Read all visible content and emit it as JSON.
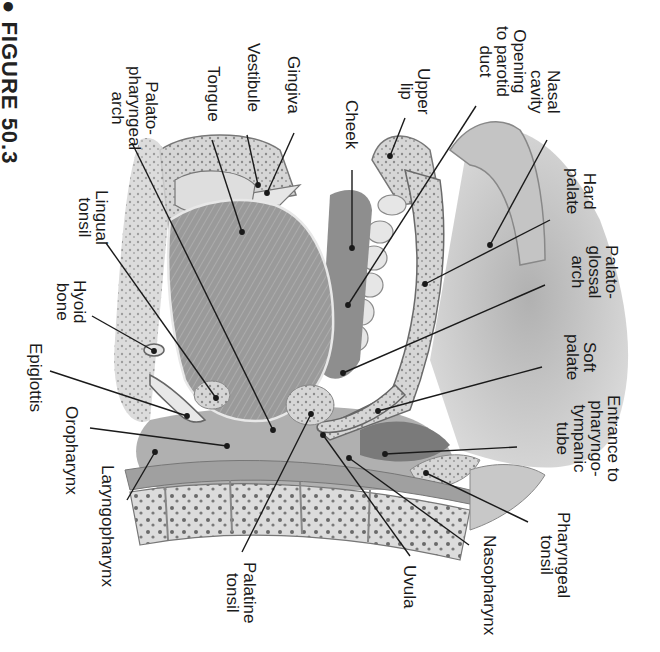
{
  "figure": {
    "caption": "● FIGURE 50.3",
    "orientation": "rotated 90° clockwise"
  },
  "labels": [
    {
      "id": "nasal-cavity",
      "text": "Nasal\ncavity",
      "x": 562,
      "y": 70
    },
    {
      "id": "opening-parotid-duct",
      "text": "Opening\nto parotid\nduct",
      "x": 528,
      "y": 26
    },
    {
      "id": "upper-lip",
      "text": "Upper\nlip",
      "x": 432,
      "y": 68
    },
    {
      "id": "cheek",
      "text": "Cheek",
      "x": 360,
      "y": 100
    },
    {
      "id": "gingiva",
      "text": "Gingiva",
      "x": 302,
      "y": 56
    },
    {
      "id": "vestibule",
      "text": "Vestibule",
      "x": 262,
      "y": 43
    },
    {
      "id": "tongue",
      "text": "Tongue",
      "x": 222,
      "y": 66
    },
    {
      "id": "palatopharyngeal-arch",
      "text": "Palato-\npharyngeal\narch",
      "x": 160,
      "y": 66
    },
    {
      "id": "hard-palate",
      "text": "Hard\npalate",
      "x": 598,
      "y": 168
    },
    {
      "id": "palatoglossal-arch",
      "text": "Palato-\nglossal\narch",
      "x": 620,
      "y": 245
    },
    {
      "id": "lingual-tonsil",
      "text": "Lingual\ntonsil",
      "x": 110,
      "y": 190
    },
    {
      "id": "hyoid-bone",
      "text": "Hyoid\nbone",
      "x": 88,
      "y": 280
    },
    {
      "id": "soft-palate",
      "text": "Soft\npalate",
      "x": 598,
      "y": 334
    },
    {
      "id": "epiglottis",
      "text": "Epiglottis",
      "x": 44,
      "y": 343
    },
    {
      "id": "oropharynx",
      "text": "Oropharynx",
      "x": 80,
      "y": 406
    },
    {
      "id": "entrance-pharyngotympanic-tube",
      "text": "Entrance to\npharyngo-\ntympanic\ntube",
      "x": 622,
      "y": 395
    },
    {
      "id": "laryngopharynx",
      "text": "Laryngopharynx",
      "x": 116,
      "y": 465
    },
    {
      "id": "pharyngeal-tonsil",
      "text": "Pharyngeal\ntonsil",
      "x": 572,
      "y": 512
    },
    {
      "id": "nasopharynx",
      "text": "Nasopharynx",
      "x": 498,
      "y": 535
    },
    {
      "id": "uvula",
      "text": "Uvula",
      "x": 418,
      "y": 565
    },
    {
      "id": "palatine-tonsil",
      "text": "Palatine\ntonsil",
      "x": 258,
      "y": 562
    }
  ],
  "leader_lines": [
    {
      "id": "nasal-cavity",
      "x1": 547,
      "y1": 140,
      "x2": 490,
      "y2": 245
    },
    {
      "id": "opening-parotid-duct",
      "x1": 476,
      "y1": 106,
      "x2": 348,
      "y2": 305
    },
    {
      "id": "upper-lip",
      "x1": 405,
      "y1": 118,
      "x2": 390,
      "y2": 156
    },
    {
      "id": "cheek",
      "x1": 352,
      "y1": 170,
      "x2": 352,
      "y2": 248
    },
    {
      "id": "gingiva",
      "x1": 294,
      "y1": 133,
      "x2": 267,
      "y2": 193
    },
    {
      "id": "vestibule",
      "x1": 247,
      "y1": 135,
      "x2": 258,
      "y2": 185
    },
    {
      "id": "tongue",
      "x1": 212,
      "y1": 140,
      "x2": 242,
      "y2": 232
    },
    {
      "id": "palatopharyngeal-arch",
      "x1": 132,
      "y1": 143,
      "x2": 273,
      "y2": 430
    },
    {
      "id": "hard-palate",
      "x1": 550,
      "y1": 220,
      "x2": 425,
      "y2": 284
    },
    {
      "id": "palatoglossal-arch",
      "x1": 545,
      "y1": 285,
      "x2": 343,
      "y2": 373
    },
    {
      "id": "lingual-tonsil",
      "x1": 106,
      "y1": 243,
      "x2": 216,
      "y2": 398
    },
    {
      "id": "hyoid-bone",
      "x1": 92,
      "y1": 316,
      "x2": 154,
      "y2": 351
    },
    {
      "id": "soft-palate",
      "x1": 542,
      "y1": 367,
      "x2": 378,
      "y2": 411
    },
    {
      "id": "epiglottis",
      "x1": 50,
      "y1": 371,
      "x2": 187,
      "y2": 416
    },
    {
      "id": "oropharynx",
      "x1": 90,
      "y1": 428,
      "x2": 227,
      "y2": 446
    },
    {
      "id": "entrance-pharyngotympanic-tube",
      "x1": 517,
      "y1": 447,
      "x2": 385,
      "y2": 454
    },
    {
      "id": "laryngopharynx",
      "x1": 127,
      "y1": 500,
      "x2": 155,
      "y2": 452
    },
    {
      "id": "pharyngeal-tonsil",
      "x1": 528,
      "y1": 522,
      "x2": 426,
      "y2": 473
    },
    {
      "id": "nasopharynx",
      "x1": 469,
      "y1": 545,
      "x2": 349,
      "y2": 458
    },
    {
      "id": "uvula",
      "x1": 410,
      "y1": 556,
      "x2": 323,
      "y2": 435
    },
    {
      "id": "palatine-tonsil",
      "x1": 242,
      "y1": 552,
      "x2": 311,
      "y2": 414
    }
  ],
  "colors": {
    "background": "#ffffff",
    "text": "#1a1a1a",
    "line": "#1a1a1a",
    "tissue_dark": "#7f7f7f",
    "tissue_mid": "#a4a4a4",
    "tissue_light": "#c8c8c8",
    "bone": "#dedede",
    "cavity_shade": "#b5b5b5"
  }
}
